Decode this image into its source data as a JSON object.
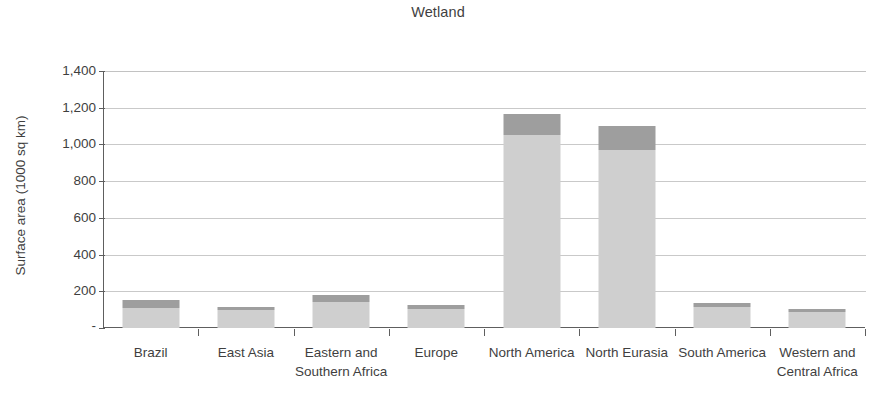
{
  "chart_data": {
    "type": "bar",
    "title": "Wetland",
    "xlabel": "",
    "ylabel": "Surface area (1000 sq km)",
    "ylim": [
      0,
      1400
    ],
    "grid": true,
    "legend_position": "none",
    "stacked": true,
    "categories": [
      "Brazil",
      "East Asia",
      "Eastern and Southern Africa",
      "Europe",
      "North America",
      "North Eurasia",
      "South America",
      "Western and Central Africa"
    ],
    "ytick_labels": [
      "1,400",
      "1,200",
      "1,000",
      "800",
      "600",
      "400",
      "200",
      "-"
    ],
    "ytick_values": [
      1400,
      1200,
      1000,
      800,
      600,
      400,
      200,
      0
    ],
    "series": [
      {
        "name": "lower-segment",
        "color": "#cfcfcf",
        "values": [
          110,
          96,
          142,
          104,
          1050,
          969,
          112,
          88
        ]
      },
      {
        "name": "upper-segment",
        "color": "#9e9e9e",
        "values": [
          45,
          18,
          36,
          20,
          118,
          132,
          24,
          17
        ]
      }
    ],
    "totals": [
      155,
      114,
      178,
      124,
      1168,
      1101,
      136,
      105
    ]
  },
  "axis": {
    "axis_color": "#5e5e5e",
    "grid_color": "#c9c9c9"
  }
}
